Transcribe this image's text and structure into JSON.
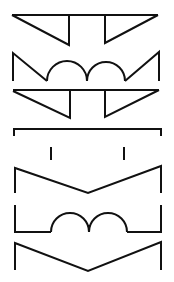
{
  "diagram": {
    "width": 174,
    "height": 282,
    "background": "#ffffff",
    "stroke": "#111111",
    "stroke_width": 2,
    "glyphs": [
      {
        "name": "glyph-1-inverted-triangles",
        "paths": [
          "M12 15 L158 15",
          "M12 15 L69 45 L69 15",
          "M105 15 L105 43 L158 15"
        ]
      },
      {
        "name": "glyph-2-double-arch-w",
        "paths": [
          "M13 81 L13 53 L47 81",
          "M47 81 A20 20 0 0 1 87 81",
          "M87 81 A19 19 0 0 1 125 81",
          "M125 81 L159 52 L159 81"
        ]
      },
      {
        "name": "glyph-3-inverted-triangles",
        "paths": [
          "M13 90 L159 90",
          "M13 91 L70 118 L70 90",
          "M105 90 L105 117 L159 90"
        ]
      },
      {
        "name": "glyph-4-bracket",
        "paths": [
          "M14 136 L14 129 L161 129 L161 136"
        ]
      },
      {
        "name": "glyph-4-ticks",
        "paths": [
          "M51 147 L51 160",
          "M124 147 L124 160"
        ]
      },
      {
        "name": "glyph-5-v-shape",
        "paths": [
          "M15 193 L15 168 L88 193 L161 166 L161 193"
        ]
      },
      {
        "name": "glyph-6-double-arch-base",
        "paths": [
          "M15 205 L15 232 L51 232",
          "M51 232 A19 19 0 0 1 89 232",
          "M89 232 A19 19 0 0 1 127 232",
          "M127 232 L161 232 L161 205",
          "M89 232 L89 225"
        ]
      },
      {
        "name": "glyph-7-v-shape",
        "paths": [
          "M15 270 L15 243 L88 271 L161 242 L161 270"
        ]
      }
    ]
  }
}
